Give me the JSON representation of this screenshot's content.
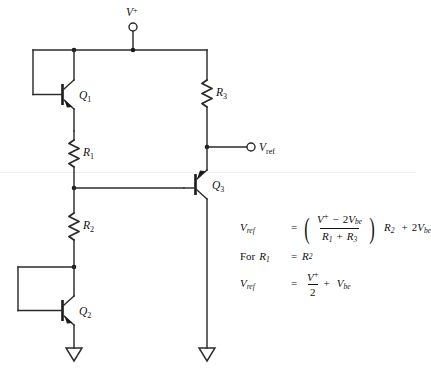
{
  "diagram": {
    "supply_terminal_label": "V+",
    "output_terminal_label": "Vref",
    "components": [
      {
        "id": "Q1",
        "type": "transistor",
        "label": "Q1"
      },
      {
        "id": "Q2",
        "type": "transistor",
        "label": "Q2"
      },
      {
        "id": "Q3",
        "type": "transistor",
        "label": "Q3"
      },
      {
        "id": "R1",
        "type": "resistor",
        "label": "R1"
      },
      {
        "id": "R2",
        "type": "resistor",
        "label": "R2"
      },
      {
        "id": "R3",
        "type": "resistor",
        "label": "R3"
      }
    ],
    "labels": {
      "vplus": "V",
      "vplus_sup": "+",
      "vref": "V",
      "vref_sub": "ref",
      "q1": "Q",
      "q1_sub": "1",
      "q2": "Q",
      "q2_sub": "2",
      "q3": "Q",
      "q3_sub": "3",
      "r1": "R",
      "r1_sub": "1",
      "r2": "R",
      "r2_sub": "2",
      "r3": "R",
      "r3_sub": "3"
    },
    "ground_symbols": 2,
    "line_color": "#2b2b2b",
    "background_color": "#ffffff"
  },
  "equations": {
    "eq1": {
      "lhs": "V",
      "lhs_sub": "ref",
      "relation": "=",
      "numerator_v": "V",
      "numerator_sup": "+",
      "numerator_rest": "2",
      "numerator_vbe": "V",
      "numerator_vbe_sub": "be",
      "numerator_minus": "−",
      "denominator_r1": "R",
      "denominator_r1_sub": "1",
      "denominator_plus": "+",
      "denominator_r3": "R",
      "denominator_r3_sub": "3",
      "tail_r2": "R",
      "tail_r2_sub": "2",
      "tail_plus": "+",
      "tail_coeff": "2",
      "tail_vbe": "V",
      "tail_vbe_sub": "be",
      "plain": "Vref = ((V+ - 2Vbe)/(R1 + R3)) R2 + 2Vbe"
    },
    "eq2": {
      "prefix": "For",
      "lhs": "R",
      "lhs_sub": "1",
      "relation": "=",
      "rhs": "R",
      "rhs_sub": "2",
      "plain": "For R1 = R2"
    },
    "eq3": {
      "lhs": "V",
      "lhs_sub": "ref",
      "relation": "=",
      "numerator_v": "V",
      "numerator_sup": "+",
      "denominator": "2",
      "plus": "+",
      "tail_vbe": "V",
      "tail_vbe_sub": "be",
      "plain": "Vref = V+/2 + Vbe"
    }
  }
}
